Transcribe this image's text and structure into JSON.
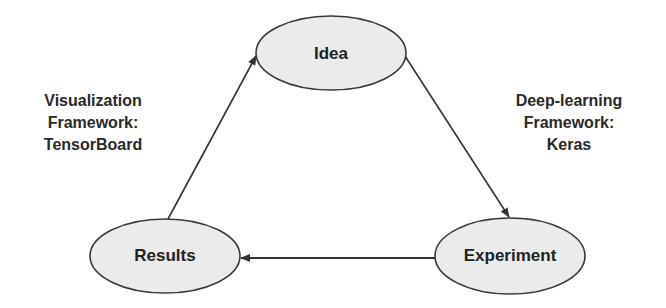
{
  "diagram": {
    "type": "cycle",
    "colors": {
      "node_fill": "#ebebeb",
      "node_stroke": "#3a3a3a",
      "edge": "#333333",
      "text": "#222222"
    },
    "nodes": [
      {
        "id": "idea",
        "label": "Idea",
        "cx": 331,
        "cy": 53,
        "rx": 75,
        "ry": 37
      },
      {
        "id": "experiment",
        "label": "Experiment",
        "cx": 510,
        "cy": 256,
        "rx": 75,
        "ry": 38
      },
      {
        "id": "results",
        "label": "Results",
        "cx": 165,
        "cy": 256,
        "rx": 75,
        "ry": 37
      }
    ],
    "edges": [
      {
        "from": "idea",
        "to": "experiment"
      },
      {
        "from": "experiment",
        "to": "results"
      },
      {
        "from": "results",
        "to": "idea"
      }
    ],
    "annotations": {
      "left": {
        "lines": [
          "Visualization",
          "Framework:",
          "TensorBoard"
        ],
        "attached_edge": "results-to-idea"
      },
      "right": {
        "lines": [
          "Deep-learning",
          "Framework:",
          "Keras"
        ],
        "attached_edge": "idea-to-experiment"
      }
    }
  }
}
